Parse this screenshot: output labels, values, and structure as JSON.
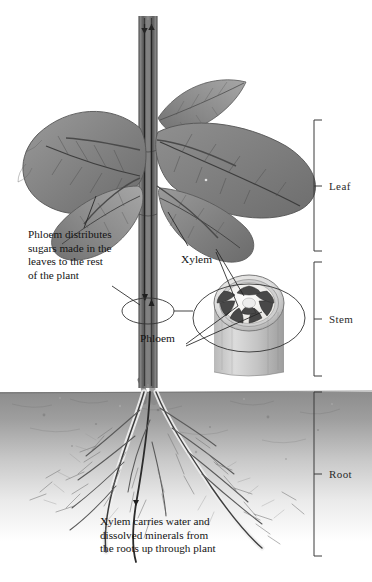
{
  "figure": {
    "kind": "botanical-diagram",
    "background_color": "#ffffff",
    "ink_color": "#111111"
  },
  "annotations": {
    "phloem_callout": "Phloem distributes\nsugars made in the\nleaves to the rest\nof the plant",
    "xylem_caption": "Xylem carries water and\ndissolved minerals from\nthe roots up through plant",
    "xylem_label": "Xylem",
    "phloem_label": "Phloem"
  },
  "brackets": [
    {
      "label": "Leaf",
      "top": 120,
      "bottom": 251
    },
    {
      "label": "Stem",
      "top": 262,
      "bottom": 376
    },
    {
      "label": "Root",
      "top": 392,
      "bottom": 556
    }
  ],
  "cross_section": {
    "name": "stem-cross-section",
    "bundle_count": 8,
    "bundle_color": "#4a4a4a",
    "ring_color": "#bdbdbd",
    "core_color": "#f2f0ec"
  },
  "soil": {
    "line_y": 392,
    "top_color": "#8d8d8d",
    "bottom_color": "#ffffff"
  },
  "flow_arrows": {
    "xylem_direction": "up",
    "phloem_direction": "down"
  },
  "palette": {
    "leaf_dark": "#6f6f6f",
    "leaf_mid": "#8c8c8c",
    "leaf_light": "#a8a8a8",
    "stem": "#6a6a6a",
    "root": "#5a5a5a",
    "leader_line": "#2a2a2a"
  }
}
